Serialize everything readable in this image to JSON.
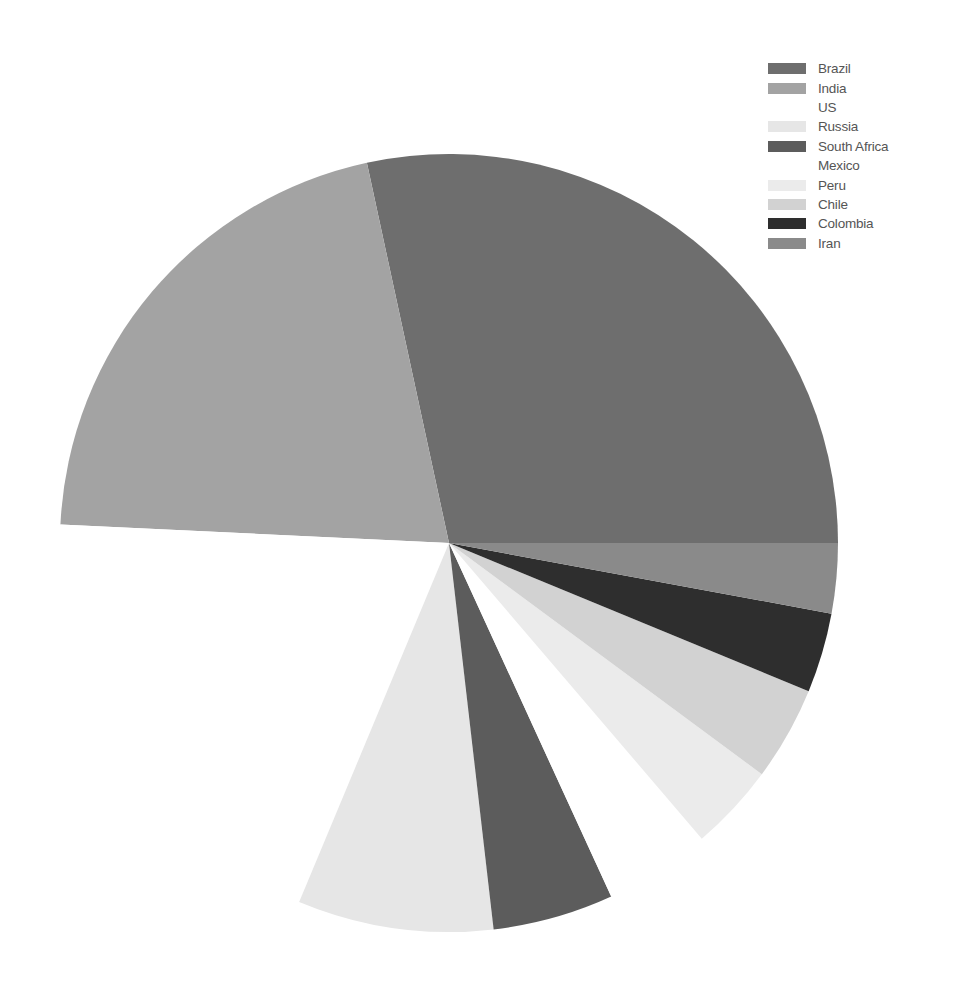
{
  "chart_data": {
    "type": "pie",
    "title": "",
    "categories": [
      "Brazil",
      "India",
      "US",
      "Russia",
      "South Africa",
      "Mexico",
      "Peru",
      "Chile",
      "Colombia",
      "Iran"
    ],
    "values": [
      28.3,
      20.8,
      19.4,
      8.1,
      5.0,
      4.4,
      3.6,
      3.9,
      3.3,
      2.9
    ],
    "colors": [
      "#6e6e6e",
      "#a3a3a3",
      "#ffffff",
      "#e6e6e6",
      "#5c5c5c",
      "#ffffff",
      "#ebebeb",
      "#d2d2d2",
      "#2e2e2e",
      "#8a8a8a"
    ],
    "start_angle_deg": 0,
    "direction": "counterclockwise",
    "legend_position": "upper right",
    "center": [
      449,
      543
    ],
    "radius": 389
  },
  "legend": {
    "items": [
      {
        "label": "Brazil",
        "color": "#6e6e6e"
      },
      {
        "label": "India",
        "color": "#a3a3a3"
      },
      {
        "label": "US",
        "color": "#ffffff"
      },
      {
        "label": "Russia",
        "color": "#e6e6e6"
      },
      {
        "label": "South Africa",
        "color": "#5c5c5c"
      },
      {
        "label": "Mexico",
        "color": "#ffffff"
      },
      {
        "label": "Peru",
        "color": "#ebebeb"
      },
      {
        "label": "Chile",
        "color": "#d2d2d2"
      },
      {
        "label": "Colombia",
        "color": "#2e2e2e"
      },
      {
        "label": "Iran",
        "color": "#8a8a8a"
      }
    ]
  }
}
